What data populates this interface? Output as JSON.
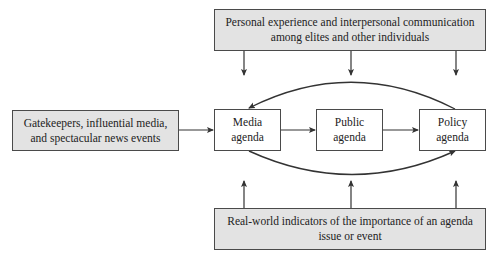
{
  "diagram": {
    "type": "flow-diagram",
    "title": "",
    "nodes": {
      "personal_experience": {
        "label": "Personal experience and interpersonal communication\namong elites and other individuals",
        "style": "gray"
      },
      "gatekeepers": {
        "label": "Gatekeepers, influential media,\nand spectacular news events",
        "style": "gray"
      },
      "media_agenda": {
        "label": "Media\nagenda",
        "style": "white"
      },
      "public_agenda": {
        "label": "Public\nagenda",
        "style": "white"
      },
      "policy_agenda": {
        "label": "Policy\nagenda",
        "style": "white"
      },
      "real_world": {
        "label": "Real-world indicators of the importance of an agenda\nissue or event",
        "style": "gray"
      }
    },
    "edges": [
      {
        "from": "gatekeepers",
        "to": "media_agenda",
        "kind": "straight"
      },
      {
        "from": "media_agenda",
        "to": "public_agenda",
        "kind": "straight"
      },
      {
        "from": "public_agenda",
        "to": "policy_agenda",
        "kind": "straight"
      },
      {
        "from": "policy_agenda",
        "to": "media_agenda",
        "kind": "curved-over"
      },
      {
        "from": "media_agenda",
        "to": "policy_agenda",
        "kind": "curved-under"
      },
      {
        "from": "personal_experience",
        "to": "media_agenda",
        "kind": "down"
      },
      {
        "from": "personal_experience",
        "to": "public_agenda",
        "kind": "down"
      },
      {
        "from": "personal_experience",
        "to": "policy_agenda",
        "kind": "down"
      },
      {
        "from": "real_world",
        "to": "media_agenda",
        "kind": "up"
      },
      {
        "from": "real_world",
        "to": "public_agenda",
        "kind": "up"
      },
      {
        "from": "real_world",
        "to": "policy_agenda",
        "kind": "up"
      }
    ],
    "colors": {
      "gray_fill": "#e3e3e3",
      "border": "#4a4a4a",
      "arrow": "#333333"
    }
  }
}
